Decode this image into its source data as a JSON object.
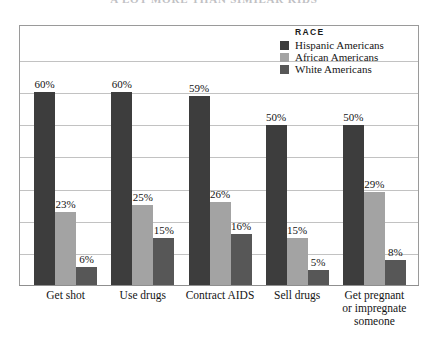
{
  "title": "A LOT  MORE THAN SIMILAR KIDS",
  "legend": {
    "heading": "RACE",
    "items": [
      {
        "label": "Hispanic Americans",
        "color": "#3d3d3d",
        "swatch_icon": "square-swatch-icon"
      },
      {
        "label": "African Americans",
        "color": "#a3a3a3",
        "swatch_icon": "square-swatch-icon"
      },
      {
        "label": "White Americans",
        "color": "#575757",
        "swatch_icon": "square-swatch-icon"
      }
    ]
  },
  "chart_data": {
    "type": "bar",
    "title": "A LOT  MORE THAN SIMILAR KIDS",
    "xlabel": "",
    "ylabel": "",
    "ylim": [
      0,
      70
    ],
    "grid": true,
    "grid_step": 10,
    "legend_position": "top-right",
    "legend_title": "RACE",
    "value_suffix": "%",
    "categories": [
      "Get shot",
      "Use drugs",
      "Contract AIDS",
      "Sell drugs",
      "Get pregnant or impregnate someone"
    ],
    "series": [
      {
        "name": "Hispanic Americans",
        "color": "#3d3d3d",
        "values": [
          60,
          60,
          59,
          50,
          50
        ]
      },
      {
        "name": "African Americans",
        "color": "#a3a3a3",
        "values": [
          23,
          25,
          26,
          15,
          29
        ]
      },
      {
        "name": "White Americans",
        "color": "#575757",
        "values": [
          6,
          15,
          16,
          5,
          8
        ]
      }
    ],
    "data_labels": [
      [
        "60%",
        "23%",
        "6%"
      ],
      [
        "60%",
        "25%",
        "15%"
      ],
      [
        "59%",
        "26%",
        "16%"
      ],
      [
        "50%",
        "15%",
        "5%"
      ],
      [
        "50%",
        "29%",
        "8%"
      ]
    ]
  },
  "axis": {
    "category_labels": [
      {
        "line1": "Get shot",
        "line2": "",
        "line3": ""
      },
      {
        "line1": "Use drugs",
        "line2": "",
        "line3": ""
      },
      {
        "line1": "Contract AIDS",
        "line2": "",
        "line3": ""
      },
      {
        "line1": "Sell drugs",
        "line2": "",
        "line3": ""
      },
      {
        "line1": "Get pregnant",
        "line2": "or impregnate",
        "line3": "someone"
      }
    ]
  }
}
